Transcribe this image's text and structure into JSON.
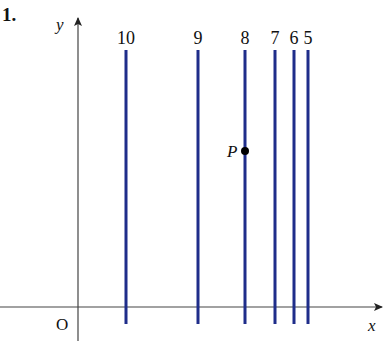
{
  "problem_number": "1.",
  "axes": {
    "x_label": "x",
    "y_label": "y",
    "origin_label": "O"
  },
  "lines": [
    {
      "label": "10",
      "x_px": 126
    },
    {
      "label": "9",
      "x_px": 198
    },
    {
      "label": "8",
      "x_px": 245
    },
    {
      "label": "7",
      "x_px": 275
    },
    {
      "label": "6",
      "x_px": 294
    },
    {
      "label": "5",
      "x_px": 308
    }
  ],
  "point": {
    "label": "P",
    "on_line": "8"
  },
  "colors": {
    "line": "#1f2d8a",
    "axis": "#333333",
    "text": "#111111"
  }
}
